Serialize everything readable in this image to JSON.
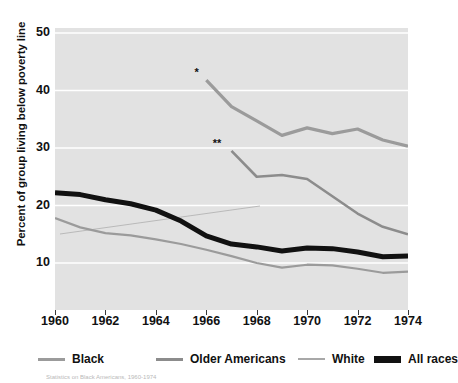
{
  "chart_data": {
    "type": "line",
    "title": "",
    "xlabel": "",
    "ylabel": "Percent of group living below poverty line",
    "x": [
      1960,
      1961,
      1962,
      1963,
      1964,
      1965,
      1966,
      1967,
      1968,
      1969,
      1970,
      1971,
      1972,
      1973,
      1974
    ],
    "xlim": [
      1960,
      1974
    ],
    "ylim": [
      0,
      50
    ],
    "xticks": [
      1960,
      1962,
      1964,
      1966,
      1968,
      1970,
      1972,
      1974
    ],
    "xtick_labels": [
      "1960",
      "1962",
      "1964",
      "1966",
      "1968",
      "1970",
      "1972",
      "1974"
    ],
    "yticks": [
      10,
      20,
      30,
      40,
      50
    ],
    "ytick_labels": [
      "10",
      "20",
      "30",
      "40",
      "50"
    ],
    "grid": "horizontal-white",
    "plot_background": "#e2e2e2",
    "legend_position": "bottom",
    "series": [
      {
        "name": "Black",
        "color": "#9b9b9b",
        "width": 3.2,
        "marker_note": "*",
        "x": [
          1966,
          1967,
          1968,
          1969,
          1970,
          1971,
          1972,
          1973,
          1974
        ],
        "values": [
          41.8,
          37.2,
          34.7,
          32.2,
          33.5,
          32.5,
          33.3,
          31.4,
          30.3
        ]
      },
      {
        "name": "Older Americans",
        "color": "#8c8c8c",
        "width": 2.6,
        "marker_note": "**",
        "x": [
          1967,
          1968,
          1969,
          1970,
          1971,
          1972,
          1973,
          1974
        ],
        "values": [
          29.5,
          25.0,
          25.3,
          24.6,
          21.6,
          18.6,
          16.3,
          15.0
        ]
      },
      {
        "name": "White",
        "color": "#9b9b9b",
        "width": 2.2,
        "marker_note": "",
        "x": [
          1960,
          1961,
          1962,
          1963,
          1964,
          1965,
          1966,
          1967,
          1968,
          1969,
          1970,
          1971,
          1972,
          1973,
          1974
        ],
        "values": [
          17.8,
          16.2,
          15.2,
          14.8,
          14.1,
          13.3,
          12.3,
          11.2,
          10.0,
          9.2,
          9.7,
          9.6,
          9.0,
          8.3,
          8.5
        ]
      },
      {
        "name": "All races",
        "color": "#111111",
        "width": 5.0,
        "marker_note": "",
        "x": [
          1960,
          1961,
          1962,
          1963,
          1964,
          1965,
          1966,
          1967,
          1968,
          1969,
          1970,
          1971,
          1972,
          1973,
          1974
        ],
        "values": [
          22.2,
          21.9,
          21.0,
          20.3,
          19.2,
          17.3,
          14.7,
          13.3,
          12.8,
          12.1,
          12.6,
          12.5,
          11.9,
          11.1,
          11.2
        ]
      }
    ],
    "annotations": [
      {
        "id": "black-series-start-marker",
        "text": "*",
        "x": 1965.7,
        "y": 42.5
      },
      {
        "id": "older-americans-series-start-marker",
        "text": "**",
        "x": 1966.6,
        "y": 30.2
      }
    ]
  },
  "legend": {
    "entries": [
      {
        "label": "Black",
        "color": "#9b9b9b",
        "thickness": "3px"
      },
      {
        "label": "Older Americans",
        "color": "#8c8c8c",
        "thickness": "3px"
      },
      {
        "label": "White",
        "color": "#a8a8a8",
        "thickness": "2px"
      },
      {
        "label": "All races",
        "color": "#111111",
        "thickness": "7px"
      }
    ]
  },
  "footnote": {
    "text": "Statistics on Black Americans, 1960-1974"
  }
}
